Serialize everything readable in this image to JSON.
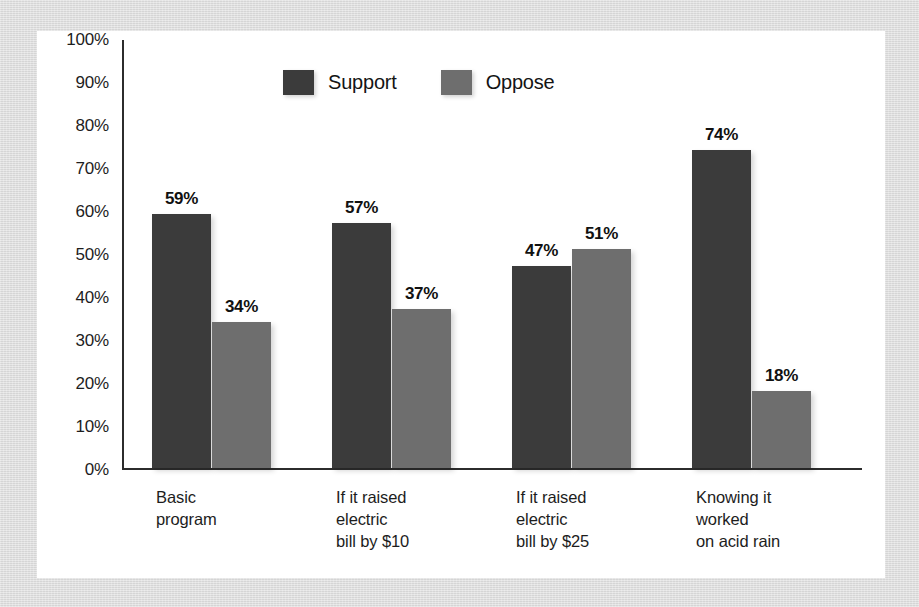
{
  "chart_data": {
    "type": "bar",
    "title": "",
    "xlabel": "",
    "ylabel": "",
    "ylim": [
      0,
      100
    ],
    "grid": false,
    "legend_position": "top-center",
    "ytick_labels": [
      "100%",
      "90%",
      "80%",
      "70%",
      "60%",
      "50%",
      "40%",
      "30%",
      "20%",
      "10%",
      "0%"
    ],
    "ytick_values": [
      100,
      90,
      80,
      70,
      60,
      50,
      40,
      30,
      20,
      10,
      0
    ],
    "categories": [
      "Basic\nprogram",
      "If it raised\nelectric\nbill by $10",
      "If it raised\nelectric\nbill by $25",
      "Knowing it\nworked\non acid rain"
    ],
    "series": [
      {
        "name": "Support",
        "color": "#3b3b3b",
        "values": [
          59,
          57,
          47,
          74
        ],
        "value_labels": [
          "59%",
          "57%",
          "47%",
          "74%"
        ]
      },
      {
        "name": "Oppose",
        "color": "#6e6e6e",
        "values": [
          34,
          37,
          51,
          18
        ],
        "value_labels": [
          "34%",
          "37%",
          "51%",
          "18%"
        ]
      }
    ]
  },
  "legend": {
    "items": [
      {
        "label": "Support",
        "color": "#3b3b3b"
      },
      {
        "label": "Oppose",
        "color": "#6e6e6e"
      }
    ]
  },
  "colors": {
    "page_background": "#dcdcdc",
    "panel_background": "#ffffff",
    "axis": "#2c2c2c",
    "text": "#1d1d1d",
    "support": "#3b3b3b",
    "oppose": "#6e6e6e"
  }
}
